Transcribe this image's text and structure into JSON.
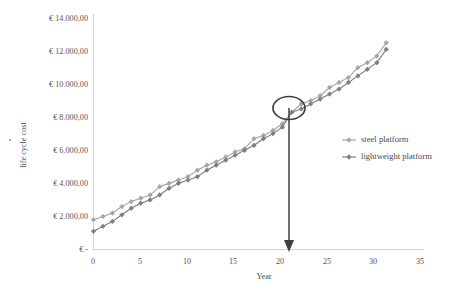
{
  "chart_data": {
    "type": "line",
    "title": "",
    "xlabel": "Year",
    "ylabel": "life cycle cost",
    "xlim": [
      0,
      35
    ],
    "ylim": [
      0,
      14000
    ],
    "grid": false,
    "legend_position": "right",
    "x_ticks": [
      "0",
      "5",
      "10",
      "15",
      "20",
      "25",
      "30",
      "35"
    ],
    "x_tick_values": [
      0,
      5,
      10,
      15,
      20,
      25,
      30,
      35
    ],
    "y_ticks": [
      "€ -",
      "€ 2.000,00",
      "€ 4.000,00",
      "€ 6.000,00",
      "€ 8.000,00",
      "€ 10.000,00",
      "€ 12.000,00",
      "€ 14.000,00"
    ],
    "y_ticks_display": [
      "€  -",
      "€ 2.000,00",
      "€ 4.000,00",
      "€ 6.000,00",
      "€ 8.000,00",
      "€ 10.000,00",
      "€ 12.000,00",
      "€ 14.000,00"
    ],
    "y_tick_values": [
      0,
      2000,
      4000,
      6000,
      8000,
      10000,
      12000,
      14000
    ],
    "x": [
      0,
      1,
      2,
      3,
      4,
      5,
      6,
      7,
      8,
      9,
      10,
      11,
      12,
      13,
      14,
      15,
      16,
      17,
      18,
      19,
      20,
      21,
      22,
      23,
      24,
      25,
      26,
      27,
      28,
      29,
      30,
      31
    ],
    "series": [
      {
        "name": "steel platform",
        "color": "#a6a6a6",
        "values": [
          1800,
          2000,
          2200,
          2600,
          2900,
          3100,
          3300,
          3800,
          4000,
          4200,
          4400,
          4800,
          5100,
          5300,
          5600,
          5900,
          6100,
          6700,
          6900,
          7200,
          7600,
          8300,
          8800,
          9000,
          9300,
          9800,
          10100,
          10400,
          11000,
          11300,
          11700,
          12500
        ]
      },
      {
        "name": "lightweight platform",
        "color": "#808080",
        "values": [
          1100,
          1400,
          1700,
          2100,
          2500,
          2800,
          3000,
          3300,
          3700,
          4000,
          4200,
          4400,
          4800,
          5100,
          5400,
          5700,
          6000,
          6300,
          6700,
          7000,
          7400,
          8300,
          8500,
          8800,
          9100,
          9400,
          9700,
          10100,
          10500,
          10900,
          11300,
          12100
        ]
      }
    ],
    "annotations": [
      {
        "type": "ellipse",
        "name": "crossover-highlight",
        "x": 21,
        "y": 8300,
        "label": ""
      },
      {
        "type": "arrow",
        "name": "crossover-arrow",
        "from_x": 21,
        "from_y": 8300,
        "to_x": 21,
        "to_y": 0,
        "label": ""
      }
    ]
  }
}
